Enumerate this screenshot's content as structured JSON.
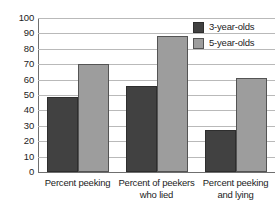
{
  "chart_data": {
    "type": "bar",
    "title": "",
    "xlabel": "",
    "ylabel": "",
    "ylim": [
      0,
      100
    ],
    "yticks": [
      0,
      10,
      20,
      30,
      40,
      50,
      60,
      70,
      80,
      90,
      100
    ],
    "grid": true,
    "legend_position": "top-right",
    "categories": [
      "Percent peeking",
      "Percent of peekers who lied",
      "Percent peeking and lying"
    ],
    "category_lines": [
      [
        "Percent peeking"
      ],
      [
        "Percent of peekers",
        "who lied"
      ],
      [
        "Percent peeking",
        "and lying"
      ]
    ],
    "series": [
      {
        "name": "3-year-olds",
        "color": "#414141",
        "values": [
          49,
          56,
          27
        ]
      },
      {
        "name": "5-year-olds",
        "color": "#9d9d9d",
        "values": [
          70,
          88,
          61
        ]
      }
    ]
  }
}
